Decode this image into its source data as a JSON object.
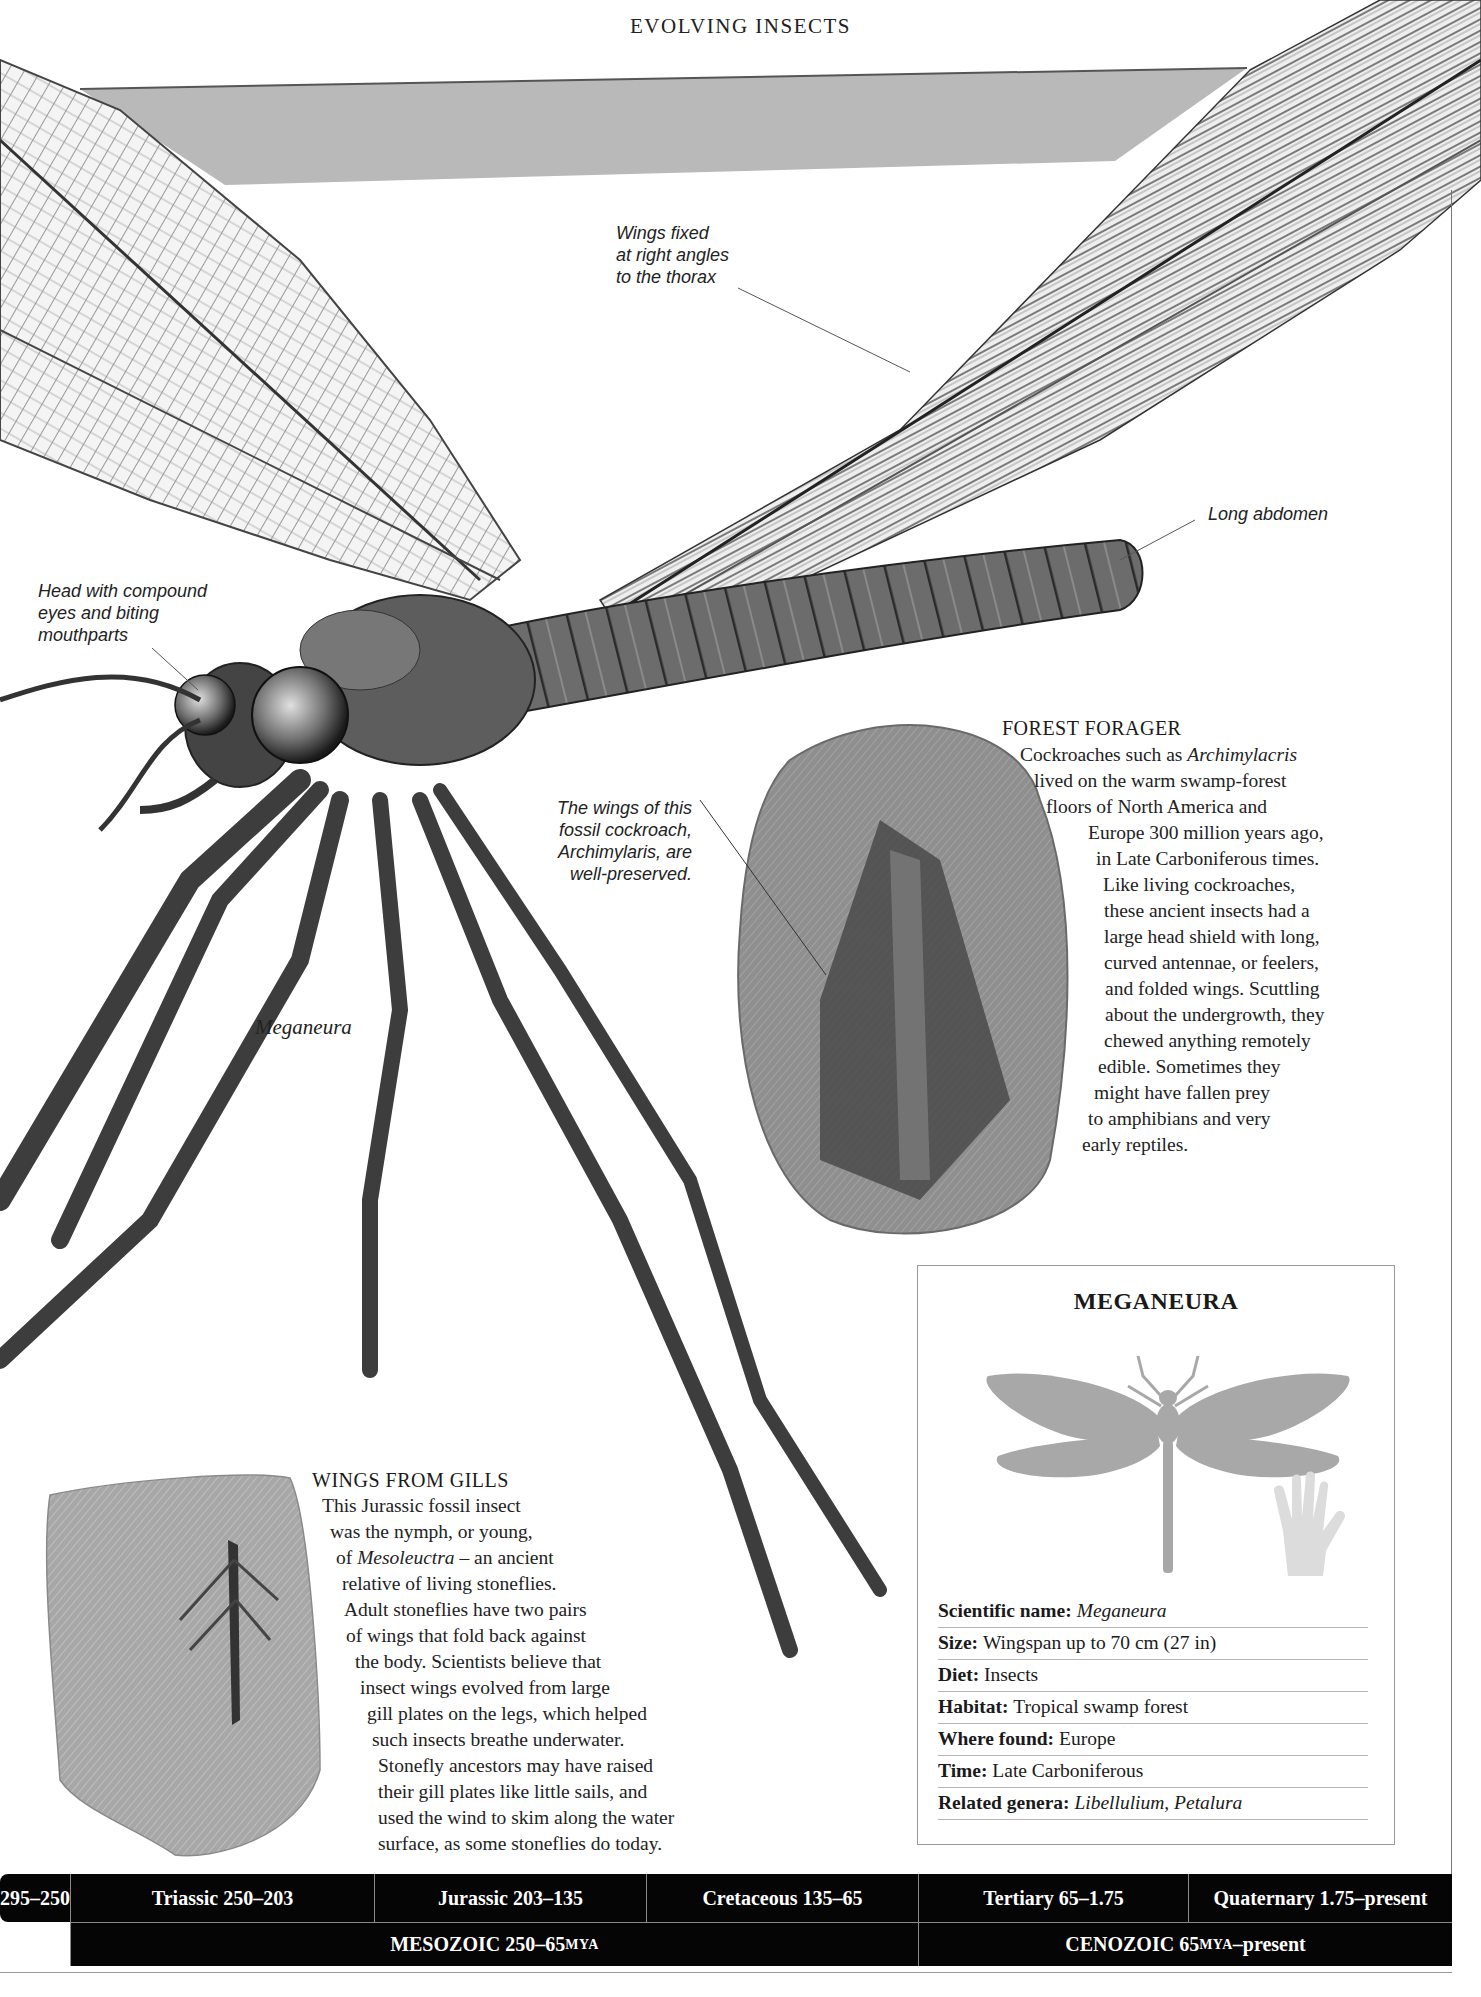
{
  "header": {
    "running_title": "EVOLVING INSECTS"
  },
  "callouts": {
    "wings_fixed": [
      "Wings fixed",
      "at right angles",
      "to the thorax"
    ],
    "long_abdomen": "Long abdomen",
    "head": [
      "Head with compound",
      "eyes and biting",
      "mouthparts"
    ],
    "fossil_wings": [
      "The wings of this",
      "fossil cockroach,",
      "Archimylaris, are",
      "well-preserved."
    ]
  },
  "illustration_caption": "Meganeura",
  "forest_forager": {
    "heading": "FOREST FORAGER",
    "lines": [
      {
        "pre": "Cockroaches such as ",
        "ital": "Archimylacris",
        "post": ""
      },
      {
        "pre": "lived on the warm swamp-forest",
        "ital": "",
        "post": ""
      },
      {
        "pre": "floors of North America and",
        "ital": "",
        "post": ""
      },
      {
        "pre": "Europe 300 million years ago,",
        "ital": "",
        "post": ""
      },
      {
        "pre": "in Late Carboniferous times.",
        "ital": "",
        "post": ""
      },
      {
        "pre": "Like living cockroaches,",
        "ital": "",
        "post": ""
      },
      {
        "pre": "these ancient insects had a",
        "ital": "",
        "post": ""
      },
      {
        "pre": "large head shield with long,",
        "ital": "",
        "post": ""
      },
      {
        "pre": "curved antennae, or feelers,",
        "ital": "",
        "post": ""
      },
      {
        "pre": "and folded wings. Scuttling",
        "ital": "",
        "post": ""
      },
      {
        "pre": "about the undergrowth, they",
        "ital": "",
        "post": ""
      },
      {
        "pre": "chewed anything remotely",
        "ital": "",
        "post": ""
      },
      {
        "pre": "edible. Sometimes they",
        "ital": "",
        "post": ""
      },
      {
        "pre": "might have fallen prey",
        "ital": "",
        "post": ""
      },
      {
        "pre": "to amphibians and very",
        "ital": "",
        "post": ""
      },
      {
        "pre": "early reptiles.",
        "ital": "",
        "post": ""
      }
    ]
  },
  "wings_from_gills": {
    "heading": "WINGS FROM GILLS",
    "lines": [
      {
        "pre": "This Jurassic fossil insect",
        "ital": "",
        "post": ""
      },
      {
        "pre": "was the nymph, or young,",
        "ital": "",
        "post": ""
      },
      {
        "pre": "of ",
        "ital": "Mesoleuctra",
        "post": " – an ancient"
      },
      {
        "pre": "relative of living stoneflies.",
        "ital": "",
        "post": ""
      },
      {
        "pre": "Adult stoneflies have two pairs",
        "ital": "",
        "post": ""
      },
      {
        "pre": "of wings that fold back against",
        "ital": "",
        "post": ""
      },
      {
        "pre": "the body. Scientists believe that",
        "ital": "",
        "post": ""
      },
      {
        "pre": "insect wings evolved from large",
        "ital": "",
        "post": ""
      },
      {
        "pre": "gill plates on the legs, which helped",
        "ital": "",
        "post": ""
      },
      {
        "pre": "such insects breathe underwater.",
        "ital": "",
        "post": ""
      },
      {
        "pre": "Stonefly ancestors may have raised",
        "ital": "",
        "post": ""
      },
      {
        "pre": "their gill plates like little sails, and",
        "ital": "",
        "post": ""
      },
      {
        "pre": "used the wind to skim along the water",
        "ital": "",
        "post": ""
      },
      {
        "pre": "surface, as some stoneflies do today.",
        "ital": "",
        "post": ""
      }
    ]
  },
  "factbox": {
    "title": "MEGANEURA",
    "silhouette_icon": "dragonfly-silhouette",
    "scale_icon": "hand-scale",
    "rows": [
      {
        "label": "Scientific name:",
        "value": "Meganeura",
        "italic": true
      },
      {
        "label": "Size:",
        "value": "Wingspan up to 70 cm (27 in)",
        "italic": false
      },
      {
        "label": "Diet:",
        "value": "Insects",
        "italic": false
      },
      {
        "label": "Habitat:",
        "value": "Tropical swamp forest",
        "italic": false
      },
      {
        "label": "Where found:",
        "value": "Europe",
        "italic": false
      },
      {
        "label": "Time:",
        "value": "Late Carboniferous",
        "italic": false
      },
      {
        "label": "Related genera:",
        "value": "Libellulium, Petalura",
        "italic": true
      }
    ]
  },
  "timeline": {
    "periods": [
      {
        "label": "295–250"
      },
      {
        "label": "Triassic 250–203"
      },
      {
        "label": "Jurassic 203–135"
      },
      {
        "label": "Cretaceous 135–65"
      },
      {
        "label": "Tertiary 65–1.75"
      },
      {
        "label": "Quaternary 1.75–present"
      }
    ],
    "eras": [
      {
        "name": "MESOZOIC 250–65 ",
        "unit": "MYA",
        "suffix": ""
      },
      {
        "name": "CENOZOIC 65 ",
        "unit": "MYA",
        "suffix": "–present"
      }
    ]
  },
  "colors": {
    "timeline_bg": "#050505",
    "panel_gray": "#b9b9b9",
    "silhouette": "#a8a8a8",
    "hand": "#d9d9d9"
  }
}
